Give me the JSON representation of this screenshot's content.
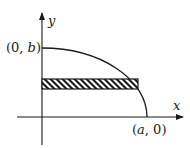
{
  "diagram": {
    "type": "quarter-ellipse-with-horizontal-strip",
    "axes": {
      "x_label": "x",
      "y_label": "y"
    },
    "points": {
      "y_intercept": {
        "label": "(0, b)",
        "x_part": "(0, ",
        "var": "b",
        "close": ")"
      },
      "x_intercept": {
        "label": "(a, 0)",
        "open": "(",
        "var": "a",
        "rest": ", 0)"
      }
    },
    "strip": {
      "orientation": "horizontal",
      "fill": "diagonal-hatch"
    },
    "colors": {
      "stroke": "#1a1a1a",
      "background": "#ffffff"
    }
  }
}
